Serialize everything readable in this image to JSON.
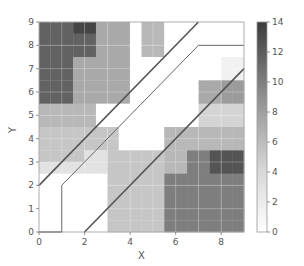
{
  "chart_data": {
    "type": "heatmap",
    "title": "",
    "xlabel": "X",
    "ylabel": "Y",
    "xlim": [
      0,
      9
    ],
    "ylim": [
      0,
      9
    ],
    "xticks": [
      0,
      2,
      4,
      6,
      8
    ],
    "yticks": [
      0,
      1,
      2,
      3,
      4,
      5,
      6,
      7,
      8,
      9
    ],
    "cell_size": 0.5,
    "grid": true,
    "colormap": "Greys",
    "colorbar": {
      "min": 0,
      "max": 14,
      "ticks": [
        0,
        2,
        4,
        6,
        8,
        10,
        12,
        14
      ]
    },
    "rows_top_to_bottom": [
      [
        11,
        11,
        11,
        13,
        13,
        6,
        6,
        6,
        0,
        5,
        5,
        0,
        0,
        0,
        0,
        0,
        0,
        0
      ],
      [
        11,
        11,
        11,
        11,
        11,
        6,
        6,
        6,
        0,
        5,
        5,
        0,
        0,
        0,
        0,
        0,
        0,
        0
      ],
      [
        11,
        11,
        11,
        11,
        11,
        6,
        6,
        6,
        0,
        5,
        5,
        0,
        0,
        0,
        0,
        0,
        0,
        0
      ],
      [
        11,
        11,
        11,
        6,
        6,
        6,
        6,
        6,
        0,
        0,
        0,
        0,
        0,
        0,
        0,
        0,
        1,
        1
      ],
      [
        11,
        11,
        11,
        6,
        6,
        6,
        6,
        6,
        0,
        0,
        0,
        0,
        0,
        0,
        0,
        0,
        1,
        1
      ],
      [
        11,
        11,
        11,
        6,
        6,
        6,
        6,
        6,
        0,
        0,
        0,
        0,
        0,
        0,
        6,
        6,
        7,
        7
      ],
      [
        11,
        11,
        11,
        6,
        6,
        6,
        6,
        6,
        0,
        0,
        0,
        0,
        0,
        0,
        6,
        6,
        7,
        7
      ],
      [
        5,
        5,
        5,
        5,
        5,
        0,
        0,
        0,
        0,
        0,
        0,
        0,
        0,
        0,
        3,
        3,
        3,
        3
      ],
      [
        5,
        5,
        5,
        5,
        5,
        0,
        0,
        0,
        0,
        0,
        0,
        0,
        0,
        0,
        3,
        3,
        3,
        3
      ],
      [
        4,
        4,
        4,
        4,
        4,
        4,
        4,
        0,
        0,
        0,
        0,
        5,
        5,
        5,
        5,
        5,
        5,
        5
      ],
      [
        4,
        4,
        4,
        4,
        4,
        4,
        4,
        0,
        0,
        0,
        0,
        5,
        5,
        5,
        5,
        5,
        5,
        5
      ],
      [
        4,
        4,
        4,
        4,
        2,
        2,
        4,
        4,
        4,
        4,
        4,
        5,
        5,
        9,
        9,
        12,
        12,
        12
      ],
      [
        2,
        2,
        2,
        2,
        2,
        2,
        4,
        4,
        4,
        4,
        4,
        5,
        5,
        9,
        9,
        12,
        12,
        12
      ],
      [
        0,
        0,
        0,
        0,
        0,
        0,
        4,
        4,
        4,
        4,
        4,
        9,
        9,
        9,
        9,
        9,
        9,
        9
      ],
      [
        0,
        0,
        0,
        0,
        0,
        0,
        4,
        4,
        4,
        4,
        4,
        9,
        9,
        9,
        9,
        9,
        9,
        9
      ],
      [
        0,
        0,
        0,
        0,
        0,
        0,
        4,
        4,
        4,
        4,
        4,
        9,
        9,
        9,
        9,
        9,
        9,
        9
      ],
      [
        0,
        0,
        0,
        0,
        0,
        0,
        4,
        4,
        4,
        4,
        4,
        9,
        9,
        9,
        9,
        9,
        9,
        9
      ],
      [
        0,
        0,
        0,
        0,
        0,
        0,
        4,
        4,
        4,
        4,
        4,
        9,
        9,
        9,
        9,
        9,
        9,
        9
      ]
    ],
    "lines": [
      {
        "name": "upper-diagonal",
        "color": "#555555",
        "width": 1.6,
        "points": [
          [
            0,
            2
          ],
          [
            7,
            9
          ]
        ]
      },
      {
        "name": "middle-corridor-line",
        "color": "#666666",
        "width": 1.0,
        "points": [
          [
            1,
            0
          ],
          [
            1,
            2
          ],
          [
            7,
            8
          ],
          [
            9,
            8
          ]
        ]
      },
      {
        "name": "lower-diagonal",
        "color": "#555555",
        "width": 1.6,
        "points": [
          [
            2,
            0
          ],
          [
            9,
            7
          ]
        ]
      },
      {
        "name": "bottom-edge-line",
        "color": "#555555",
        "width": 1.2,
        "points": [
          [
            0,
            0
          ],
          [
            1,
            0
          ]
        ]
      }
    ]
  }
}
